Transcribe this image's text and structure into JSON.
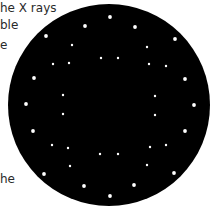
{
  "text_fragments": [
    {
      "text": "he X rays",
      "x": 0,
      "y": 1
    },
    {
      "text": "ble",
      "x": 0,
      "y": 18
    },
    {
      "text": "e",
      "x": 0,
      "y": 38
    },
    {
      "text": "he",
      "x": 0,
      "y": 172
    }
  ],
  "disc": {
    "cx": 109,
    "cy": 105,
    "r": 101,
    "color": "#000000"
  },
  "spot_color": "#ffffff",
  "spots_outer": [
    [
      110,
      17
    ],
    [
      85,
      26
    ],
    [
      135,
      27
    ],
    [
      46,
      36
    ],
    [
      175,
      39
    ],
    [
      34,
      78
    ],
    [
      185,
      79
    ],
    [
      26,
      104
    ],
    [
      194,
      105
    ],
    [
      33,
      131
    ],
    [
      185,
      131
    ],
    [
      44,
      174
    ],
    [
      174,
      173
    ],
    [
      84,
      186
    ],
    [
      134,
      185
    ],
    [
      110,
      196
    ]
  ],
  "spots_inner": [
    [
      72,
      45
    ],
    [
      147,
      47
    ],
    [
      53,
      64
    ],
    [
      69,
      63
    ],
    [
      101,
      58
    ],
    [
      118,
      58
    ],
    [
      149,
      64
    ],
    [
      166,
      66
    ],
    [
      63,
      95
    ],
    [
      155,
      96
    ],
    [
      63,
      114
    ],
    [
      155,
      115
    ],
    [
      52,
      145
    ],
    [
      68,
      148
    ],
    [
      150,
      147
    ],
    [
      166,
      145
    ],
    [
      100,
      154
    ],
    [
      118,
      154
    ],
    [
      70,
      166
    ],
    [
      147,
      165
    ]
  ]
}
